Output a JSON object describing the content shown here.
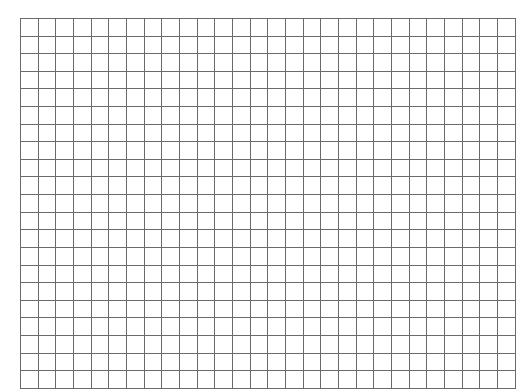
{
  "page": {
    "background_color": "#ffffff",
    "width": 508,
    "height": 382
  },
  "grid": {
    "name": "blank-grid",
    "columns": 28,
    "rows": 21,
    "cell_width": 16.7,
    "cell_height": 16.6,
    "line_color": "#6a6a6a",
    "outer_line_color": "#8f8f8f",
    "line_width": 1,
    "cell_fill": "#ffffff",
    "origin_x": 20,
    "origin_y": 18,
    "grid_width": 467,
    "grid_height": 349,
    "cell_text": "",
    "cells": []
  },
  "chart_data": {
    "type": "table",
    "title": "",
    "xlabel": "",
    "ylabel": "",
    "columns": 28,
    "rows": 21,
    "column_headers": [],
    "row_headers": [],
    "values": [],
    "grid": true,
    "legend": null,
    "annotations": []
  }
}
